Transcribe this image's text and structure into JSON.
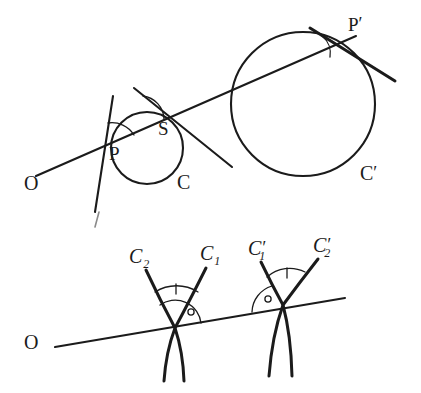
{
  "figure": {
    "ink_color": "#1b1b1b",
    "background_color": "#ffffff"
  },
  "upper": {
    "labels": {
      "origin": "O",
      "point_p": "P",
      "point_s": "S",
      "circle_c": "C",
      "point_p_prime_base": "P",
      "point_p_prime_mark": "′",
      "circle_c_prime_base": "C",
      "circle_c_prime_mark": "′"
    }
  },
  "lower": {
    "labels": {
      "origin": "O",
      "curve_c2_base": "C",
      "curve_c2_sub": "2",
      "curve_c1_base": "C",
      "curve_c1_sub": "1",
      "curve_c1_prime_base": "C",
      "curve_c1_prime_sub": "1",
      "curve_c1_prime_mark": "′",
      "curve_c2_prime_base": "C",
      "curve_c2_prime_sub": "2",
      "curve_c2_prime_mark": "′"
    }
  }
}
